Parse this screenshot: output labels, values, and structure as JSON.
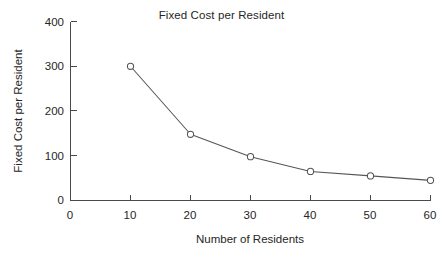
{
  "chart_data": {
    "type": "line",
    "title": "Fixed Cost per Resident",
    "xlabel": "Number of Residents",
    "ylabel": "Fixed Cost per Resident",
    "x": [
      10,
      20,
      30,
      40,
      50,
      60
    ],
    "values": [
      300,
      148,
      98,
      65,
      55,
      45
    ],
    "series": [
      {
        "name": "Fixed Cost per Resident",
        "values": [
          300,
          148,
          98,
          65,
          55,
          45
        ]
      }
    ],
    "xlim": [
      0,
      60
    ],
    "ylim": [
      0,
      400
    ],
    "xticks": [
      0,
      10,
      20,
      30,
      40,
      50,
      60
    ],
    "yticks": [
      0,
      100,
      200,
      300,
      400
    ],
    "xtick_labels": [
      "0",
      "10",
      "20",
      "30",
      "40",
      "50",
      "60"
    ],
    "ytick_labels": [
      "0",
      "100",
      "200",
      "300",
      "400"
    ],
    "grid": false,
    "legend": false,
    "marker": "open-circle",
    "line_color": "#555555",
    "marker_fill": "#ffffff",
    "axis_color": "#4a4a4a",
    "background": "#ffffff"
  }
}
